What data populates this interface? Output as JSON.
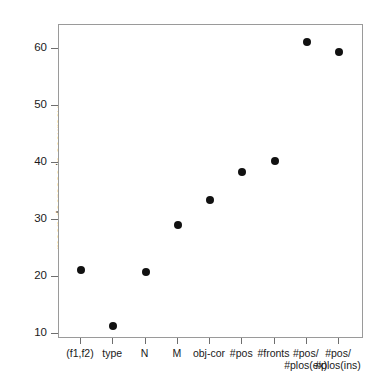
{
  "chart_data": {
    "type": "scatter",
    "title": "",
    "xlabel": "",
    "ylabel": "mean decrease in accuracy",
    "ylim": [
      7.5,
      65
    ],
    "yticks": [
      10,
      20,
      30,
      40,
      50,
      60
    ],
    "ytick_labels": [
      "10",
      "20",
      "30",
      "40",
      "50",
      "60"
    ],
    "grid": false,
    "legend": null,
    "categories": [
      "(f1,f2)",
      "type",
      "N",
      "M",
      "obj-cor",
      "#pos",
      "#fronts",
      "#pos/\n#plos(ex)",
      "#pos/\n#plos(ins)"
    ],
    "values": [
      21.2,
      11.4,
      20.8,
      29.2,
      33.5,
      38.4,
      40.4,
      61.3,
      59.5
    ],
    "marker": "filled-circle",
    "marker_color": "#111111",
    "marker_size_px": 8,
    "frame_color": "#9a9a9a",
    "background": "#ffffff"
  }
}
